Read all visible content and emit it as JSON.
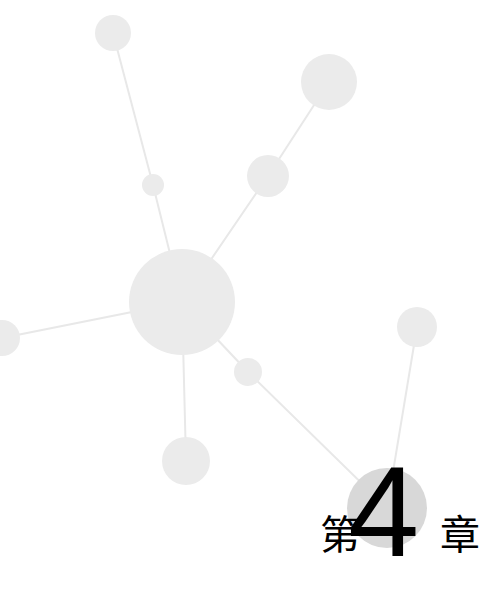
{
  "page": {
    "kind": "chapter-divider",
    "background_color": "#ffffff",
    "width": 498,
    "height": 599
  },
  "heading": {
    "prefix": "第",
    "number": "4",
    "suffix": "章",
    "full_text": "第4章",
    "text_color": "#000000",
    "number_badge_color": "#d8d8d8"
  },
  "graph": {
    "node_color": "#ebebeb",
    "edge_color": "#e8e8e8",
    "accent_node_color": "#d8d8d8",
    "nodes": [
      {
        "id": "n-top-left",
        "label": "top-left-node",
        "cx": 113,
        "cy": 33,
        "r": 18
      },
      {
        "id": "n-top-right",
        "label": "top-right-large-node",
        "cx": 329,
        "cy": 82,
        "r": 28
      },
      {
        "id": "n-upper-mid",
        "label": "upper-middle-node",
        "cx": 268,
        "cy": 176,
        "r": 21
      },
      {
        "id": "n-small-upper",
        "label": "small-upper-node",
        "cx": 153,
        "cy": 185,
        "r": 11
      },
      {
        "id": "n-hub",
        "label": "central-hub-node",
        "cx": 182,
        "cy": 302,
        "r": 53
      },
      {
        "id": "n-left-edge",
        "label": "left-edge-node",
        "cx": 2,
        "cy": 338,
        "r": 18
      },
      {
        "id": "n-right",
        "label": "right-node",
        "cx": 417,
        "cy": 327,
        "r": 20
      },
      {
        "id": "n-small-lower",
        "label": "small-lower-node",
        "cx": 248,
        "cy": 372,
        "r": 14
      },
      {
        "id": "n-bottom-left",
        "label": "bottom-left-node",
        "cx": 186,
        "cy": 461,
        "r": 24
      },
      {
        "id": "n-badge",
        "label": "chapter-number-node",
        "cx": 387,
        "cy": 508,
        "r": 40
      }
    ],
    "edges": [
      {
        "from": "n-top-left",
        "to": "n-small-upper"
      },
      {
        "from": "n-small-upper",
        "to": "n-hub"
      },
      {
        "from": "n-top-right",
        "to": "n-upper-mid"
      },
      {
        "from": "n-upper-mid",
        "to": "n-hub"
      },
      {
        "from": "n-left-edge",
        "to": "n-hub"
      },
      {
        "from": "n-hub",
        "to": "n-bottom-left"
      },
      {
        "from": "n-hub",
        "to": "n-small-lower"
      },
      {
        "from": "n-small-lower",
        "to": "n-badge"
      },
      {
        "from": "n-right",
        "to": "n-badge"
      }
    ]
  }
}
